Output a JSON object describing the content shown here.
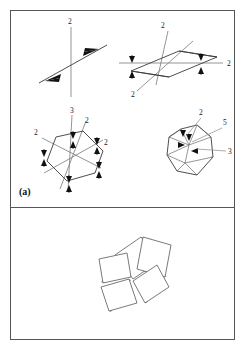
{
  "figure": {
    "panels": [
      {
        "id": "a",
        "label": "(a)",
        "diagrams": [
          {
            "name": "two-fold-axis-pair",
            "description": "vertical 2-fold axis crossed by an inclined 2-fold axis with paired arrowheads",
            "labels": [
              {
                "text": "2",
                "x": 60,
                "y": 12,
                "ref": "vertical-axis"
              }
            ],
            "axes": [
              {
                "kind": "vertical",
                "order": "2",
                "x1": 60,
                "y1": 16,
                "x2": 60,
                "y2": 86
              },
              {
                "kind": "inclined",
                "order": "2",
                "x1": 28,
                "y1": 72,
                "x2": 96,
                "y2": 34
              }
            ],
            "arrows": [
              {
                "x": 38,
                "y": 66,
                "dir": "left"
              },
              {
                "x": 78,
                "y": 45,
                "dir": "right"
              }
            ]
          },
          {
            "name": "parallelogram-two-fold-axes",
            "description": "parallelogram net with a horizontal 2-fold axis, a steep 2-fold axis and an inclined 2-fold axis; arrow pairs at the four corners",
            "labels": [
              {
                "text": "2",
                "x": 152,
                "y": 16,
                "ref": "steep-axis"
              },
              {
                "text": "2",
                "x": 218,
                "y": 54,
                "ref": "horizontal-axis"
              },
              {
                "text": "2",
                "x": 124,
                "y": 82,
                "ref": "inclined-axis"
              }
            ],
            "axes": [
              {
                "kind": "horizontal",
                "order": "2",
                "x1": 110,
                "y1": 52,
                "x2": 212,
                "y2": 52
              },
              {
                "kind": "steep",
                "order": "2",
                "x1": 156,
                "y1": 20,
                "x2": 146,
                "y2": 72
              },
              {
                "kind": "inclined",
                "order": "2",
                "x1": 128,
                "y1": 78,
                "x2": 180,
                "y2": 32
              }
            ],
            "parallelogram": [
              [
                120,
                60
              ],
              [
                168,
                40
              ],
              [
                206,
                46
              ],
              [
                158,
                66
              ]
            ],
            "arrows": [
              {
                "x": 121,
                "y": 46,
                "dir": "down"
              },
              {
                "x": 121,
                "y": 62,
                "dir": "up"
              },
              {
                "x": 190,
                "y": 44,
                "dir": "down"
              },
              {
                "x": 190,
                "y": 60,
                "dir": "up"
              }
            ]
          },
          {
            "name": "hexagonal-three-fold-axis",
            "description": "hexagonal net with a vertical 3-fold axis and three in-plane 2-fold axes carrying arrow pairs",
            "labels": [
              {
                "text": "3",
                "x": 62,
                "y": 100,
                "ref": "vertical-axis"
              },
              {
                "text": "2",
                "x": 76,
                "y": 110,
                "ref": "two-fold-axis-a"
              },
              {
                "text": "2",
                "x": 26,
                "y": 122,
                "ref": "two-fold-axis-b"
              },
              {
                "text": "2",
                "x": 94,
                "y": 132,
                "ref": "two-fold-axis-c"
              }
            ],
            "axes": [
              {
                "kind": "vertical",
                "order": "3",
                "x1": 60,
                "y1": 104,
                "x2": 58,
                "y2": 178
              },
              {
                "kind": "in-plane",
                "order": "2",
                "x1": 33,
                "y1": 128,
                "x2": 88,
                "y2": 156
              },
              {
                "kind": "in-plane",
                "order": "2",
                "x1": 90,
                "y1": 130,
                "x2": 35,
                "y2": 160
              },
              {
                "kind": "in-plane",
                "order": "2",
                "x1": 74,
                "y1": 112,
                "x2": 50,
                "y2": 176
              }
            ],
            "hexagon": [
              [
                45,
                126
              ],
              [
                72,
                120
              ],
              [
                92,
                140
              ],
              [
                84,
                162
              ],
              [
                56,
                170
              ],
              [
                36,
                150
              ]
            ],
            "arrows": [
              {
                "x": 62,
                "y": 122,
                "dir": "down"
              },
              {
                "x": 62,
                "y": 134,
                "dir": "up"
              },
              {
                "x": 86,
                "y": 128,
                "dir": "down"
              },
              {
                "x": 86,
                "y": 140,
                "dir": "up"
              },
              {
                "x": 33,
                "y": 140,
                "dir": "down"
              },
              {
                "x": 33,
                "y": 152,
                "dir": "up"
              },
              {
                "x": 88,
                "y": 152,
                "dir": "down"
              },
              {
                "x": 88,
                "y": 164,
                "dir": "up"
              },
              {
                "x": 58,
                "y": 164,
                "dir": "down"
              },
              {
                "x": 58,
                "y": 176,
                "dir": "up"
              }
            ]
          },
          {
            "name": "icosahedron-axes",
            "description": "icosahedron outline annotated with 2-fold, 5-fold and 3-fold rotation axes",
            "labels": [
              {
                "text": "2",
                "x": 190,
                "y": 104,
                "ref": "two-fold-axis"
              },
              {
                "text": "5",
                "x": 214,
                "y": 114,
                "ref": "five-fold-axis"
              },
              {
                "text": "3",
                "x": 218,
                "y": 139,
                "ref": "three-fold-axis"
              }
            ],
            "leaders": [
              {
                "from": [
                  190,
                  107
                ],
                "to": [
                  176,
                  124
                ],
                "ref": "two-fold-axis"
              },
              {
                "from": [
                  212,
                  117
                ],
                "to": [
                  180,
                  130
                ],
                "ref": "five-fold-axis"
              },
              {
                "from": [
                  216,
                  140
                ],
                "to": [
                  186,
                  137
                ],
                "ref": "three-fold-axis"
              }
            ],
            "outline": [
              [
                170,
                118
              ],
              [
                186,
                114
              ],
              [
                200,
                126
              ],
              [
                202,
                146
              ],
              [
                186,
                164
              ],
              [
                166,
                160
              ],
              [
                156,
                144
              ],
              [
                158,
                126
              ]
            ],
            "arrows": [
              {
                "x": 172,
                "y": 122,
                "dir": "down"
              },
              {
                "x": 177,
                "y": 126,
                "dir": "down"
              },
              {
                "x": 170,
                "y": 132,
                "dir": "right"
              },
              {
                "x": 183,
                "y": 137,
                "dir": "right"
              }
            ]
          }
        ]
      },
      {
        "id": "b",
        "label": "(b)",
        "diagrams": [
          {
            "name": "pinwheel-rectangle-arrangement",
            "description": "five congruent rectangles arranged with five-fold rotational (pinwheel) symmetry around a common centre",
            "tile_count": 5,
            "symmetry": "5-fold rotation",
            "tiles": [
              {
                "index": 1,
                "polygon": [
                  [
                    104,
                    244
                  ],
                  [
                    130,
                    226
                  ],
                  [
                    148,
                    250
                  ],
                  [
                    122,
                    268
                  ]
                ]
              },
              {
                "index": 2,
                "polygon": [
                  [
                    132,
                    226
                  ],
                  [
                    160,
                    234
                  ],
                  [
                    154,
                    266
                  ],
                  [
                    126,
                    258
                  ]
                ]
              },
              {
                "index": 3,
                "polygon": [
                  [
                    146,
                    254
                  ],
                  [
                    158,
                    276
                  ],
                  [
                    134,
                    292
                  ],
                  [
                    122,
                    270
                  ]
                ]
              },
              {
                "index": 4,
                "polygon": [
                  [
                    118,
                    268
                  ],
                  [
                    126,
                    292
                  ],
                  [
                    98,
                    300
                  ],
                  [
                    90,
                    276
                  ]
                ]
              },
              {
                "index": 5,
                "polygon": [
                  [
                    92,
                    272
                  ],
                  [
                    88,
                    248
                  ],
                  [
                    116,
                    242
                  ],
                  [
                    120,
                    266
                  ]
                ]
              }
            ]
          }
        ]
      }
    ]
  }
}
